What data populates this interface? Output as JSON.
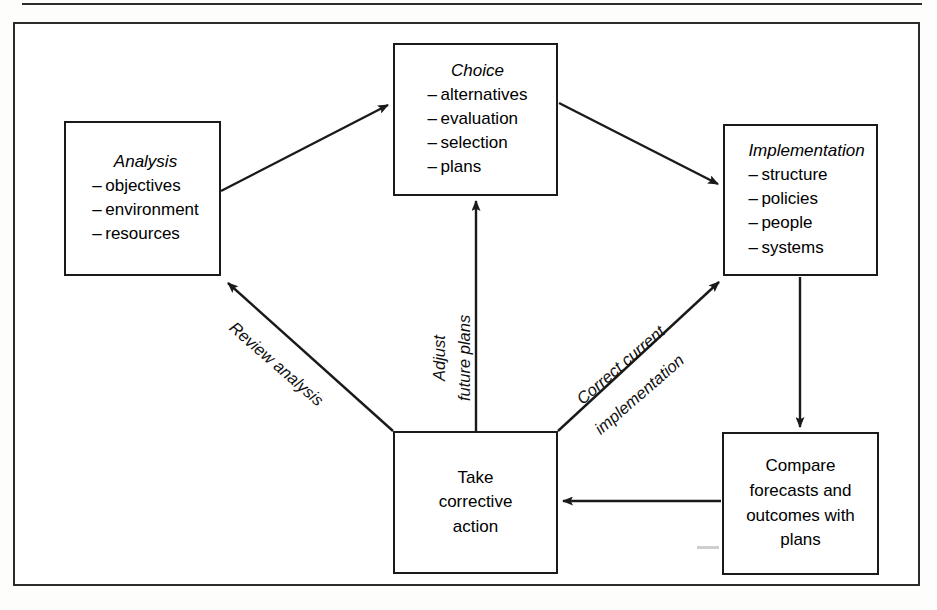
{
  "figure": {
    "kind": "flow-diagram",
    "title_visible": false,
    "line_color": "#1a1a1a",
    "background": "#ffffff"
  },
  "nodes": [
    {
      "id": "analysis",
      "title": "Analysis",
      "title_style": "italic",
      "items": [
        "objectives",
        "environment",
        "resources"
      ],
      "bullet": "–"
    },
    {
      "id": "choice",
      "title": "Choice",
      "title_style": "italic",
      "items": [
        "alternatives",
        "evaluation",
        "selection",
        "plans"
      ],
      "bullet": "–"
    },
    {
      "id": "implementation",
      "title": "Implementation",
      "title_style": "italic",
      "items": [
        "structure",
        "policies",
        "people",
        "systems"
      ],
      "bullet": "–"
    },
    {
      "id": "corrective",
      "title": null,
      "lines": [
        "Take",
        "corrective",
        "action"
      ]
    },
    {
      "id": "compare",
      "title": null,
      "lines": [
        "Compare",
        "forecasts and",
        "outcomes with",
        "plans"
      ]
    }
  ],
  "edges": [
    {
      "id": "analysis-to-choice",
      "from": "analysis",
      "to": "choice",
      "label": null,
      "style": "solid-arrow"
    },
    {
      "id": "choice-to-implementation",
      "from": "choice",
      "to": "implementation",
      "label": null,
      "style": "solid-arrow"
    },
    {
      "id": "implementation-to-compare",
      "from": "implementation",
      "to": "compare",
      "label": null,
      "style": "solid-arrow"
    },
    {
      "id": "compare-to-corrective",
      "from": "compare",
      "to": "corrective",
      "label": null,
      "style": "solid-arrow"
    },
    {
      "id": "corrective-to-analysis",
      "from": "corrective",
      "to": "analysis",
      "label": "Review analysis",
      "style": "solid-arrow"
    },
    {
      "id": "corrective-to-choice",
      "from": "corrective",
      "to": "choice",
      "label": "Adjust future plans",
      "style": "solid-arrow"
    },
    {
      "id": "corrective-to-implementation",
      "from": "corrective",
      "to": "implementation",
      "label": "Correct current implementation",
      "style": "solid-arrow"
    }
  ],
  "edge_labels": {
    "review_analysis": "Review analysis",
    "adjust_line1": "Adjust",
    "adjust_line2": "future plans",
    "correct_line1": "Correct current",
    "correct_line2": "implementation"
  }
}
